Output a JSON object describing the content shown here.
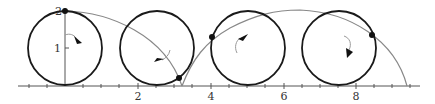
{
  "figure": {
    "colors": {
      "axis": "#555555",
      "circle": "#1a1a1a",
      "curve": "#888888",
      "point": "#111111",
      "arrow": "#111111",
      "arrow_arc": "#999999"
    },
    "axes": {
      "x_ticks": [
        {
          "label": "2",
          "value": 2
        },
        {
          "label": "4",
          "value": 4
        },
        {
          "label": "6",
          "value": 6
        },
        {
          "label": "8",
          "value": 8
        }
      ],
      "y_ticks": [
        {
          "label": "1",
          "value": 1
        },
        {
          "label": "2",
          "value": 2
        }
      ],
      "x_range": [
        -1.3,
        9.6
      ],
      "y_range": [
        0,
        2
      ]
    },
    "circles": [
      {
        "center_x": 0,
        "center_y": 1,
        "radius": 1,
        "point": [
          0,
          2
        ],
        "rotation": "clockwise"
      },
      {
        "center_x": 2.5,
        "center_y": 1,
        "radius": 1,
        "point": [
          3.2,
          0.2
        ],
        "rotation": "clockwise"
      },
      {
        "center_x": 5.0,
        "center_y": 1,
        "radius": 1,
        "point": [
          4.05,
          1.35
        ],
        "rotation": "clockwise"
      },
      {
        "center_x": 7.5,
        "center_y": 1,
        "radius": 1,
        "point": [
          8.45,
          1.4
        ],
        "rotation": "clockwise"
      }
    ]
  }
}
